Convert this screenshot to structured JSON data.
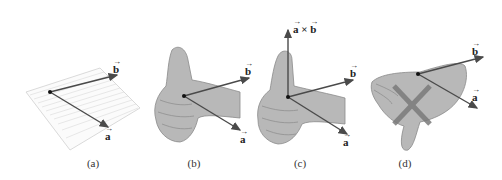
{
  "figure": {
    "panels": [
      {
        "id": "a",
        "caption": "(a)",
        "vector_a": "a",
        "vector_b": "b",
        "arrow_mark": "→"
      },
      {
        "id": "b",
        "caption": "(b)",
        "vector_a": "a",
        "vector_b": "b",
        "arrow_mark": "→"
      },
      {
        "id": "c",
        "caption": "(c)",
        "vector_a": "a",
        "vector_b": "b",
        "cross_label": "a × b",
        "cross_a": "a",
        "cross_times": "×",
        "cross_b": "b",
        "arrow_mark": "→"
      },
      {
        "id": "d",
        "caption": "(d)",
        "vector_a": "a",
        "vector_b": "b",
        "arrow_mark": "→",
        "mark": "X (incorrect)"
      }
    ],
    "colors": {
      "vector": "#4a4a4a",
      "hand_fill": "#b8b8b8",
      "hand_stroke": "#8a8a8a",
      "plane_line": "#d0d0d0",
      "cross_mark": "#7a7a7a"
    }
  }
}
